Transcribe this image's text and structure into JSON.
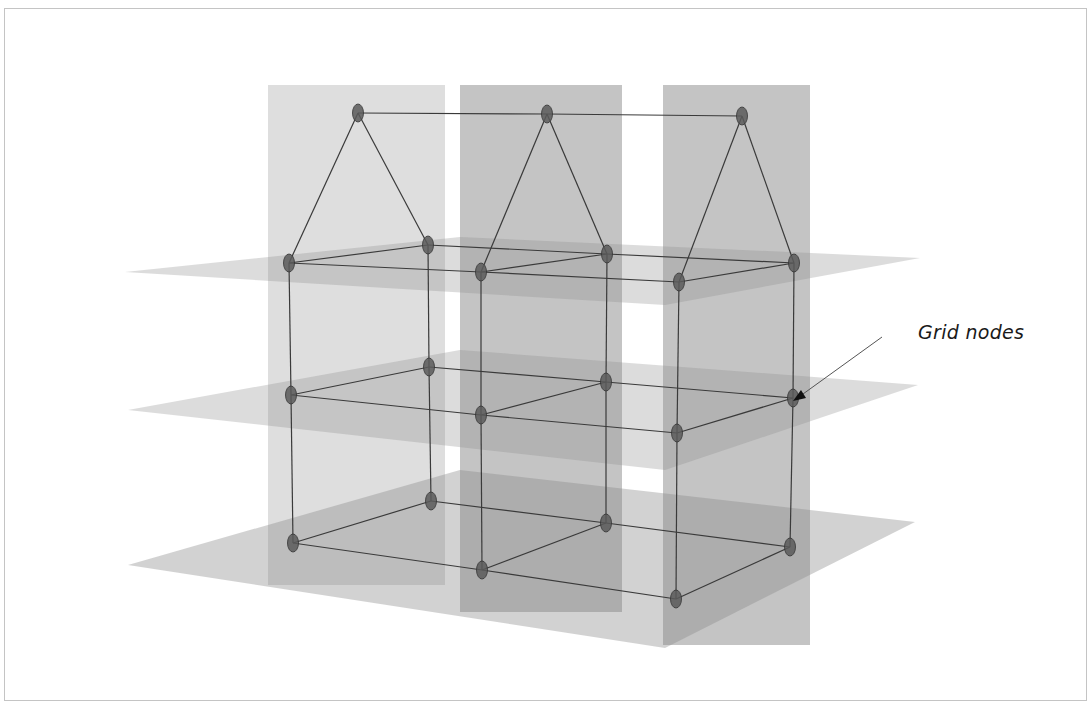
{
  "diagram": {
    "title": "",
    "annotation": {
      "label": "Grid nodes",
      "arrow_from": [
        882,
        337
      ],
      "arrow_to": [
        793,
        401
      ]
    },
    "colors": {
      "background": "#ffffff",
      "frame": "#c4c4c4",
      "plane_fill": "#8a8a8a",
      "node_fill": "#5a5a5a",
      "node_stroke": "#333333",
      "edge": "#3a3a3a",
      "label": "#1a1a1a"
    },
    "vertical_planes": [
      {
        "id": "v1",
        "x": 268,
        "y": 85,
        "w": 177,
        "h": 500,
        "opacity": 0.28
      },
      {
        "id": "v2",
        "x": 460,
        "y": 85,
        "w": 162,
        "h": 527,
        "opacity": 0.5
      },
      {
        "id": "v3",
        "x": 663,
        "y": 85,
        "w": 147,
        "h": 560,
        "opacity": 0.5
      }
    ],
    "horizontal_planes": [
      {
        "id": "h-top",
        "points": [
          [
            125,
            272
          ],
          [
            460,
            237
          ],
          [
            920,
            258
          ],
          [
            665,
            305
          ]
        ],
        "opacity": 0.3
      },
      {
        "id": "h-mid",
        "points": [
          [
            128,
            410
          ],
          [
            460,
            350
          ],
          [
            918,
            385
          ],
          [
            665,
            470
          ]
        ],
        "opacity": 0.3
      },
      {
        "id": "h-bot",
        "points": [
          [
            128,
            565
          ],
          [
            460,
            470
          ],
          [
            915,
            522
          ],
          [
            665,
            648
          ]
        ],
        "opacity": 0.38
      }
    ],
    "nodes": {
      "apex": [
        [
          358,
          113
        ],
        [
          547,
          114
        ],
        [
          742,
          116
        ]
      ],
      "top_front": [
        [
          289,
          263
        ],
        [
          481,
          272
        ],
        [
          679,
          282
        ]
      ],
      "top_back": [
        [
          428,
          245
        ],
        [
          607,
          254
        ],
        [
          794,
          263
        ]
      ],
      "mid_front": [
        [
          291,
          395
        ],
        [
          481,
          415
        ],
        [
          677,
          433
        ]
      ],
      "mid_back": [
        [
          429,
          367
        ],
        [
          606,
          382
        ],
        [
          793,
          398
        ]
      ],
      "bot_front": [
        [
          293,
          543
        ],
        [
          482,
          570
        ],
        [
          676,
          599
        ]
      ],
      "bot_back": [
        [
          431,
          501
        ],
        [
          606,
          523
        ],
        [
          790,
          547
        ]
      ]
    }
  }
}
